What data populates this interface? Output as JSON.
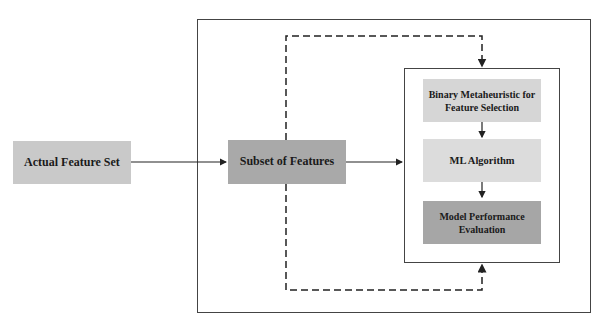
{
  "diagram": {
    "nodes": {
      "actual": {
        "label": "Actual Feature Set",
        "color": "#c9c9c9"
      },
      "subset": {
        "label": "Subset of Features",
        "color": "#a9a9a9"
      },
      "binary": {
        "label": "Binary Metaheuristic for Feature Selection",
        "color": "#d6d6d6"
      },
      "ml": {
        "label": "ML Algorithm",
        "color": "#dcdcdc"
      },
      "eval": {
        "label": "Model Performance Evaluation",
        "color": "#a6a6a6"
      }
    },
    "edges": [
      {
        "from": "actual",
        "to": "subset",
        "style": "solid"
      },
      {
        "from": "subset",
        "to": "inner-box",
        "style": "solid"
      },
      {
        "from": "binary",
        "to": "ml",
        "style": "solid"
      },
      {
        "from": "ml",
        "to": "eval",
        "style": "solid"
      },
      {
        "from": "subset",
        "to": "inner-box-top",
        "style": "dashed"
      },
      {
        "from": "subset",
        "to": "inner-box-bottom",
        "style": "dashed"
      }
    ]
  }
}
